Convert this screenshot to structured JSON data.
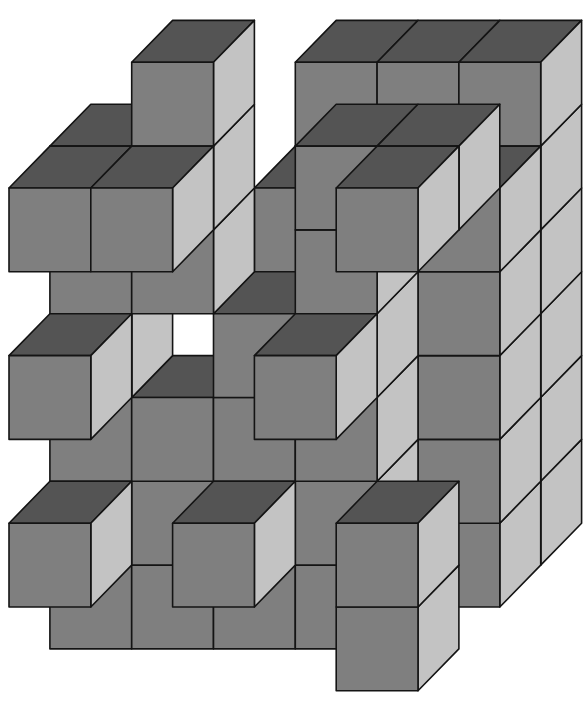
{
  "figure": {
    "title": "Isometric cube assembly",
    "width": 586,
    "height": 710
  },
  "colors": {
    "background": "#ffffff",
    "top_face": "#545454",
    "front_face": "#7f7f7f",
    "side_face": "#c3c3c3",
    "outline": "#141414"
  },
  "projection": {
    "origin_x": 9,
    "origin_y": 188,
    "cell_w": 81.8,
    "cell_h": 83.8,
    "depth_dx": 40.9,
    "depth_dy": -41.9
  },
  "cubes": [
    {
      "c": 2,
      "r": 0,
      "d": 3
    },
    {
      "c": 3,
      "r": 0,
      "d": 3
    },
    {
      "c": 4,
      "r": 0,
      "d": 3
    },
    {
      "c": 2,
      "r": 1,
      "d": 3
    },
    {
      "c": 3,
      "r": 1,
      "d": 3
    },
    {
      "c": 4,
      "r": 1,
      "d": 3
    },
    {
      "c": 2,
      "r": 2,
      "d": 3
    },
    {
      "c": 3,
      "r": 2,
      "d": 3
    },
    {
      "c": 4,
      "r": 2,
      "d": 3
    },
    {
      "c": 2,
      "r": 3,
      "d": 3
    },
    {
      "c": 3,
      "r": 3,
      "d": 3
    },
    {
      "c": 4,
      "r": 3,
      "d": 3
    },
    {
      "c": 2,
      "r": 4,
      "d": 3
    },
    {
      "c": 3,
      "r": 4,
      "d": 3
    },
    {
      "c": 4,
      "r": 4,
      "d": 3
    },
    {
      "c": 2,
      "r": 5,
      "d": 3
    },
    {
      "c": 3,
      "r": 5,
      "d": 3
    },
    {
      "c": 4,
      "r": 5,
      "d": 3
    },
    {
      "c": 2,
      "r": 1,
      "d": 2
    },
    {
      "c": 4,
      "r": 1,
      "d": 2
    },
    {
      "c": 2,
      "r": 2,
      "d": 2
    },
    {
      "c": 3,
      "r": 2,
      "d": 2
    },
    {
      "c": 4,
      "r": 2,
      "d": 2
    },
    {
      "c": 3,
      "r": 3,
      "d": 2
    },
    {
      "c": 4,
      "r": 3,
      "d": 2
    },
    {
      "c": 2,
      "r": 4,
      "d": 2
    },
    {
      "c": 3,
      "r": 4,
      "d": 2
    },
    {
      "c": 4,
      "r": 4,
      "d": 2
    },
    {
      "c": 2,
      "r": 5,
      "d": 2
    },
    {
      "c": 3,
      "r": 5,
      "d": 2
    },
    {
      "c": 4,
      "r": 5,
      "d": 2
    },
    {
      "c": 1,
      "r": -1,
      "d": 1
    },
    {
      "c": 0,
      "r": 0,
      "d": 1
    },
    {
      "c": 1,
      "r": 0,
      "d": 1
    },
    {
      "c": 3,
      "r": 0,
      "d": 1
    },
    {
      "c": 4,
      "r": 0,
      "d": 1
    },
    {
      "c": 0,
      "r": 1,
      "d": 1
    },
    {
      "c": 1,
      "r": 1,
      "d": 1
    },
    {
      "c": 3,
      "r": 1,
      "d": 1
    },
    {
      "c": 0,
      "r": 2,
      "d": 1
    },
    {
      "c": 2,
      "r": 2,
      "d": 1
    },
    {
      "c": 3,
      "r": 2,
      "d": 1
    },
    {
      "c": 0,
      "r": 3,
      "d": 1
    },
    {
      "c": 1,
      "r": 3,
      "d": 1
    },
    {
      "c": 2,
      "r": 3,
      "d": 1
    },
    {
      "c": 3,
      "r": 3,
      "d": 1
    },
    {
      "c": 0,
      "r": 4,
      "d": 1
    },
    {
      "c": 1,
      "r": 4,
      "d": 1
    },
    {
      "c": 2,
      "r": 4,
      "d": 1
    },
    {
      "c": 3,
      "r": 4,
      "d": 1
    },
    {
      "c": 0,
      "r": 5,
      "d": 1
    },
    {
      "c": 1,
      "r": 5,
      "d": 1
    },
    {
      "c": 2,
      "r": 5,
      "d": 1
    },
    {
      "c": 3,
      "r": 5,
      "d": 1
    },
    {
      "c": 0,
      "r": 0,
      "d": 0
    },
    {
      "c": 1,
      "r": 0,
      "d": 0
    },
    {
      "c": 4,
      "r": 0,
      "d": 0
    },
    {
      "c": 0,
      "r": 2,
      "d": 0
    },
    {
      "c": 3,
      "r": 2,
      "d": 0
    },
    {
      "c": 0,
      "r": 4,
      "d": 0
    },
    {
      "c": 2,
      "r": 4,
      "d": 0
    },
    {
      "c": 4,
      "r": 4,
      "d": 0
    },
    {
      "c": 4,
      "r": 5,
      "d": 0
    }
  ]
}
